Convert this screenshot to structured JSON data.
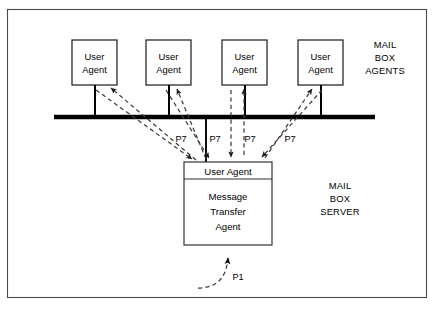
{
  "diagram": {
    "frame": {
      "stroke_color": "#4a4a4a"
    },
    "agents": [
      {
        "id": "agent-1",
        "line1": "User",
        "line2": "Agent"
      },
      {
        "id": "agent-2",
        "line1": "User",
        "line2": "Agent"
      },
      {
        "id": "agent-3",
        "line1": "User",
        "line2": "Agent"
      },
      {
        "id": "agent-4",
        "line1": "User",
        "line2": "Agent"
      }
    ],
    "agents_group_label": {
      "line1": "MAIL",
      "line2": "BOX",
      "line3": "AGENTS"
    },
    "server": {
      "header_label": "User Agent",
      "body_line1": "Message",
      "body_line2": "Transfer",
      "body_line3": "Agent"
    },
    "server_group_label": {
      "line1": "MAIL",
      "line2": "BOX",
      "line3": "SERVER"
    },
    "protocol_labels": [
      {
        "id": "p7-1",
        "text": "P7"
      },
      {
        "id": "p7-2",
        "text": "P7"
      },
      {
        "id": "p7-3",
        "text": "P7"
      },
      {
        "id": "p7-4",
        "text": "P7"
      },
      {
        "id": "p1",
        "text": "P1"
      }
    ],
    "colors": {
      "ink": "#000000",
      "frame": "#4a4a4a",
      "dashed": "#3d3d3d",
      "background": "#ffffff"
    }
  }
}
